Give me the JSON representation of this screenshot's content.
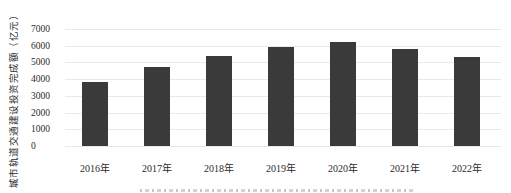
{
  "chart_data": {
    "type": "bar",
    "title": "",
    "xlabel": "",
    "ylabel": "城市轨道交通建设投资完成额（亿元）",
    "categories": [
      "2016年",
      "2017年",
      "2018年",
      "2019年",
      "2020年",
      "2021年",
      "2022年"
    ],
    "values": [
      3800,
      4700,
      5400,
      5900,
      6250,
      5800,
      5350
    ],
    "ylim": [
      0,
      7000
    ],
    "ytick_interval": 1000,
    "yticks": [
      "7000",
      "6000",
      "5000",
      "4000",
      "3000",
      "2000",
      "1000",
      "0"
    ],
    "grid": "horizontal-only",
    "legend": "none",
    "bar_color": "#3a3a3a",
    "gridline_color": "#e9e9e9",
    "text_color": "#2b2b2b"
  }
}
